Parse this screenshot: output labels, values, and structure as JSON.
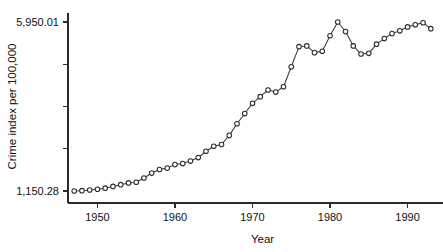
{
  "chart_data": {
    "type": "line",
    "title": "",
    "subtitle": "",
    "xlabel": "Year",
    "ylabel": "Crime index per 100,000",
    "xlim": [
      1946.2,
      1993.8
    ],
    "ylim": [
      1150.28,
      5950.01
    ],
    "xticks": [
      1950,
      1960,
      1970,
      1980,
      1990
    ],
    "xticklabels": [
      "1950",
      "1960",
      "1970",
      "1980",
      "1990"
    ],
    "yticks": [
      1150.28,
      2350.21,
      3550.15,
      4750.08,
      5950.01
    ],
    "yticklabels": [
      "1,150.28",
      "",
      "",
      "",
      "5,950.01"
    ],
    "ylabel_bottom": "1,150.28",
    "ylabel_top": "5,950.01",
    "grid": false,
    "legend": false,
    "marker": "circle-open",
    "series": [
      {
        "name": "Crime index",
        "x": [
          1947,
          1948,
          1949,
          1950,
          1951,
          1952,
          1953,
          1954,
          1955,
          1956,
          1957,
          1958,
          1959,
          1960,
          1961,
          1962,
          1963,
          1964,
          1965,
          1966,
          1967,
          1968,
          1969,
          1970,
          1971,
          1972,
          1973,
          1974,
          1975,
          1976,
          1977,
          1978,
          1979,
          1980,
          1981,
          1982,
          1983,
          1984,
          1985,
          1986,
          1987,
          1988,
          1989,
          1990,
          1991,
          1992,
          1993
        ],
        "values": [
          1150.28,
          1160.0,
          1180.0,
          1200.0,
          1230.0,
          1280.0,
          1330.0,
          1380.0,
          1400.0,
          1520.0,
          1660.0,
          1760.0,
          1800.0,
          1900.0,
          1930.0,
          2000.0,
          2100.0,
          2280.0,
          2420.0,
          2470.0,
          2730.0,
          3060.0,
          3350.0,
          3640.0,
          3830.0,
          4020.0,
          3960.0,
          4110.0,
          4680.0,
          5250.0,
          5270.0,
          5080.0,
          5120.0,
          5560.0,
          5950.01,
          5680.0,
          5270.0,
          5040.0,
          5060.0,
          5320.0,
          5480.0,
          5620.0,
          5700.0,
          5810.0,
          5870.0,
          5930.0,
          5760.0
        ]
      }
    ]
  },
  "figure": {
    "plot_left": 68,
    "plot_right": 437,
    "plot_top": 22,
    "plot_bottom": 191
  }
}
